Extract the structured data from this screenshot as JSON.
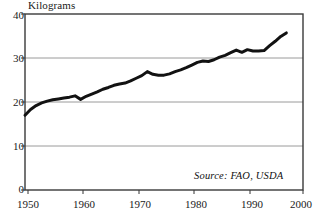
{
  "chart_data": {
    "type": "line",
    "title": "",
    "subtitle": "",
    "xlabel": "",
    "ylabel": "Kilograms",
    "xlim": [
      1950,
      2000
    ],
    "ylim": [
      0,
      40
    ],
    "xticks": [
      1950,
      1960,
      1970,
      1980,
      1990,
      2000
    ],
    "xtick_labels": [
      "1950",
      "1960",
      "1970",
      "1980",
      "1990",
      "2000"
    ],
    "yticks": [
      0,
      10,
      20,
      30,
      40
    ],
    "ytick_labels": [
      "0",
      "10",
      "20",
      "30",
      "40"
    ],
    "grid": "horizontal-only",
    "gridlines_at": [
      10,
      20,
      30
    ],
    "legend": "none",
    "annotations": [
      {
        "text": "Source: FAO, USDA",
        "position": "bottom-right-inside-plot",
        "style": "italic"
      }
    ],
    "line_color": "#121212",
    "line_width_px": 3,
    "series": [
      {
        "name": "Kilograms per person",
        "x": [
          1950,
          1951,
          1952,
          1953,
          1954,
          1955,
          1956,
          1957,
          1958,
          1959,
          1960,
          1961,
          1962,
          1963,
          1964,
          1965,
          1966,
          1967,
          1968,
          1969,
          1970,
          1971,
          1972,
          1973,
          1974,
          1975,
          1976,
          1977,
          1978,
          1979,
          1980,
          1981,
          1982,
          1983,
          1984,
          1985,
          1986,
          1987,
          1988,
          1989,
          1990,
          1991,
          1992,
          1993,
          1994,
          1995,
          1996,
          1997
        ],
        "values": [
          17.0,
          18.3,
          19.2,
          19.8,
          20.2,
          20.5,
          20.7,
          20.9,
          21.1,
          21.4,
          20.6,
          21.3,
          21.8,
          22.3,
          22.9,
          23.3,
          23.8,
          24.1,
          24.3,
          24.8,
          25.4,
          26.0,
          26.9,
          26.3,
          26.1,
          26.1,
          26.4,
          26.9,
          27.3,
          27.8,
          28.4,
          29.0,
          29.3,
          29.2,
          29.6,
          30.2,
          30.6,
          31.2,
          31.8,
          31.3,
          31.9,
          31.6,
          31.6,
          31.7,
          32.8,
          33.8,
          34.9,
          35.7
        ]
      }
    ]
  },
  "axes": {
    "y_axis_name": "kilograms-axis",
    "x_axis_name": "year-axis"
  },
  "source": {
    "text": "Source: FAO, USDA"
  }
}
